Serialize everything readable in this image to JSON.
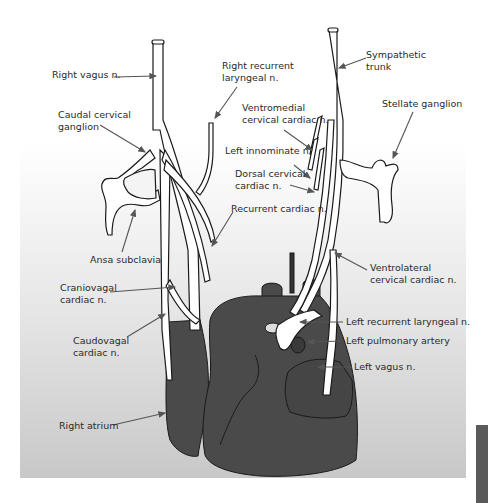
{
  "figure": {
    "type": "anatomical-illustration",
    "colors": {
      "heart": "#4a4a4a",
      "nerve_fill": "#ffffff",
      "outline": "#1a1a1a",
      "label_text": "#2a2a2a",
      "leader_line": "#555555",
      "side_tab": "#5a5a5a"
    },
    "labels": {
      "right_vagus": "Right vagus n.",
      "right_recurrent_laryngeal_1": "Right recurrent",
      "right_recurrent_laryngeal_2": "laryngeal n.",
      "sympathetic_trunk_1": "Sympathetic",
      "sympathetic_trunk_2": "trunk",
      "caudal_cervical_ganglion_1": "Caudal cervical",
      "caudal_cervical_ganglion_2": "ganglion",
      "ventromedial_1": "Ventromedial",
      "ventromedial_2": "cervical cardiac n.",
      "stellate_ganglion": "Stellate ganglion",
      "left_innominate": "Left innominate n.",
      "dorsal_cervical_1": "Dorsal cervical",
      "dorsal_cervical_2": "cardiac n.",
      "recurrent_cardiac": "Recurrent cardiac n.",
      "ansa_subclavia": "Ansa subclavia",
      "ventrolateral_1": "Ventrolateral",
      "ventrolateral_2": "cervical cardiac n.",
      "craniovagal_1": "Craniovagal",
      "craniovagal_2": "cardiac n.",
      "caudovagal_1": "Caudovagal",
      "caudovagal_2": "cardiac n.",
      "left_recurrent_laryngeal": "Left recurrent laryngeal n.",
      "left_pulmonary_artery": "Left pulmonary artery",
      "left_vagus": "Left vagus n.",
      "right_atrium": "Right atrium"
    }
  }
}
